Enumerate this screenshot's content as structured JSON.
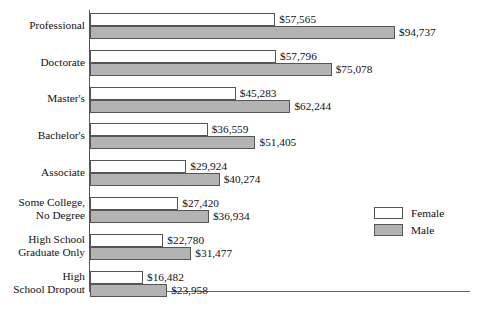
{
  "chart_data": {
    "type": "bar",
    "orientation": "horizontal",
    "title": "",
    "subtitle": "",
    "xlabel": "",
    "ylabel": "",
    "grid": false,
    "xlim": [
      0,
      94737
    ],
    "axis_tick_labels": [],
    "legend_position": "right",
    "categories": [
      "Professional",
      "Doctorate",
      "Master's",
      "Bachelor's",
      "Associate",
      "Some College,\nNo Degree",
      "High School\nGraduate Only",
      "High\nSchool Dropout"
    ],
    "series": [
      {
        "name": "Female",
        "color": "#ffffff",
        "values": [
          57565,
          57796,
          45283,
          36559,
          29924,
          27420,
          22780,
          16482
        ],
        "labels": [
          "$57,565",
          "$57,796",
          "$45,283",
          "$36,559",
          "$29,924",
          "$27,420",
          "$22,780",
          "$16,482"
        ]
      },
      {
        "name": "Male",
        "color": "#b3b3b3",
        "values": [
          94737,
          75078,
          62244,
          51405,
          40274,
          36934,
          31477,
          23958
        ],
        "labels": [
          "$94,737",
          "$75,078",
          "$62,244",
          "$51,405",
          "$40,274",
          "$36,934",
          "$31,477",
          "$23,958"
        ]
      }
    ]
  },
  "legend": {
    "items": [
      {
        "label": "Female",
        "swatch": "female"
      },
      {
        "label": "Male",
        "swatch": "male"
      }
    ]
  }
}
